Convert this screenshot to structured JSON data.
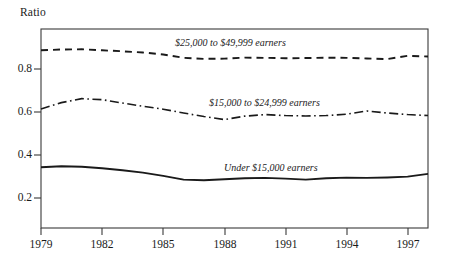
{
  "figure": {
    "y_axis_title": "Ratio",
    "background_color": "#ffffff",
    "ink_color": "#1a1a1a"
  },
  "chart_data": {
    "type": "line",
    "title": "",
    "subtitle": "",
    "xlabel": "",
    "ylabel": "Ratio",
    "xlim": [
      1979,
      1998
    ],
    "ylim": [
      0,
      1.0
    ],
    "grid": false,
    "legend_position": "inline-labels",
    "x_tick_labels": [
      "1979",
      "1982",
      "1985",
      "1988",
      "1991",
      "1994",
      "1997"
    ],
    "x_ticks": [
      1979,
      1982,
      1985,
      1988,
      1991,
      1994,
      1997
    ],
    "y_tick_labels": [
      "0.8",
      "0.6",
      "0.4",
      "0.2"
    ],
    "y_ticks": [
      0.8,
      0.6,
      0.4,
      0.2
    ],
    "x": [
      1979,
      1980,
      1981,
      1982,
      1983,
      1984,
      1985,
      1986,
      1987,
      1988,
      1989,
      1990,
      1991,
      1992,
      1993,
      1994,
      1995,
      1996,
      1997,
      1998
    ],
    "series": [
      {
        "name": "$25,000 to $49,999 earners",
        "line_style": "dashed",
        "values": [
          0.893,
          0.897,
          0.898,
          0.893,
          0.888,
          0.882,
          0.872,
          0.855,
          0.85,
          0.851,
          0.856,
          0.855,
          0.853,
          0.854,
          0.856,
          0.855,
          0.852,
          0.849,
          0.865,
          0.862
        ],
        "label_text": "$25,000 to $49,999 earners"
      },
      {
        "name": "$15,000 to $24,999 earners",
        "line_style": "dash-dot",
        "values": [
          0.598,
          0.63,
          0.65,
          0.645,
          0.628,
          0.612,
          0.597,
          0.578,
          0.56,
          0.545,
          0.562,
          0.57,
          0.565,
          0.563,
          0.565,
          0.572,
          0.588,
          0.578,
          0.57,
          0.565
        ],
        "label_text": "$15,000 to $24,999 earners"
      },
      {
        "name": "Under $15,000 earners",
        "line_style": "solid",
        "values": [
          0.305,
          0.31,
          0.308,
          0.3,
          0.29,
          0.278,
          0.262,
          0.243,
          0.24,
          0.245,
          0.25,
          0.252,
          0.248,
          0.243,
          0.25,
          0.253,
          0.252,
          0.254,
          0.258,
          0.272
        ],
        "label_text": "Under $15,000 earners"
      }
    ]
  },
  "labels": {
    "series_upper": "$25,000 to $49,999 earners",
    "series_middle": "$15,000 to $24,999 earners",
    "series_lower": "Under $15,000 earners"
  },
  "y_tick_text": {
    "t08": "0.8",
    "t06": "0.6",
    "t04": "0.4",
    "t02": "0.2"
  },
  "x_tick_text": {
    "t1979": "1979",
    "t1982": "1982",
    "t1985": "1985",
    "t1988": "1988",
    "t1991": "1991",
    "t1994": "1994",
    "t1997": "1997"
  }
}
